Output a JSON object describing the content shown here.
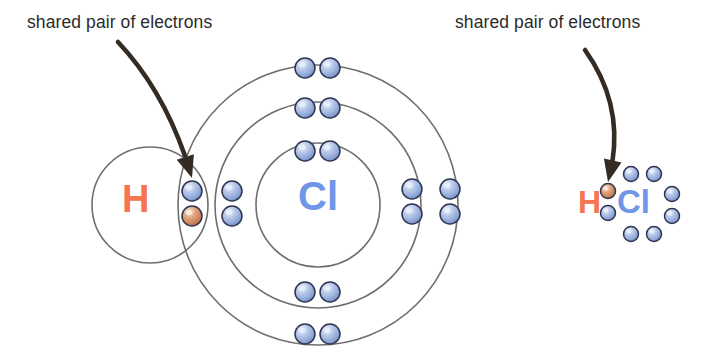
{
  "diagram": {
    "background_color": "#ffffff"
  },
  "annotations": [
    {
      "id": "left-annotation",
      "text": "shared pair of electrons",
      "x": 27,
      "y": 12,
      "arrow": {
        "from": [
          118,
          42
        ],
        "control": [
          168,
          95
        ],
        "to": [
          192,
          178
        ]
      }
    },
    {
      "id": "right-annotation",
      "text": "shared pair of electrons",
      "x": 455,
      "y": 12,
      "arrow": {
        "from": [
          585,
          50
        ],
        "control": [
          628,
          110
        ],
        "to": [
          608,
          182
        ]
      }
    }
  ],
  "left_model": {
    "name": "shell-model",
    "hydrogen": {
      "label": "H",
      "label_color": "#f4754f",
      "circle": {
        "cx": 150,
        "cy": 205,
        "r": 58
      }
    },
    "chlorine": {
      "label": "Cl",
      "label_color": "#6f96e8",
      "shells": [
        {
          "name": "inner-shell",
          "cx": 318,
          "cy": 205,
          "r": 62
        },
        {
          "name": "middle-shell",
          "cx": 318,
          "cy": 205,
          "r": 103
        },
        {
          "name": "outer-shell",
          "cx": 318,
          "cy": 205,
          "r": 140
        }
      ]
    },
    "electron_colors": {
      "chlorine_electron": "#9fb4e0",
      "hydrogen_electron": "#d98a63",
      "rim": "#2f3550",
      "highlight": "#e8eefb"
    },
    "electrons": [
      {
        "name": "shared-electron-cl",
        "cx": 192,
        "cy": 191,
        "r": 10,
        "type": "chlorine"
      },
      {
        "name": "shared-electron-h",
        "cx": 192,
        "cy": 216,
        "r": 10,
        "type": "hydrogen"
      },
      {
        "name": "middle-shell-electron-left-upper",
        "cx": 232,
        "cy": 191,
        "r": 10,
        "type": "chlorine"
      },
      {
        "name": "middle-shell-electron-left-lower",
        "cx": 232,
        "cy": 216,
        "r": 10,
        "type": "chlorine"
      },
      {
        "name": "inner-shell-electron-top-left",
        "cx": 305,
        "cy": 151,
        "r": 10,
        "type": "chlorine"
      },
      {
        "name": "inner-shell-electron-top-right",
        "cx": 330,
        "cy": 151,
        "r": 10,
        "type": "chlorine"
      },
      {
        "name": "middle-shell-electron-top-left",
        "cx": 305,
        "cy": 108,
        "r": 10,
        "type": "chlorine"
      },
      {
        "name": "middle-shell-electron-top-right",
        "cx": 330,
        "cy": 108,
        "r": 10,
        "type": "chlorine"
      },
      {
        "name": "outer-shell-electron-top-left",
        "cx": 305,
        "cy": 68,
        "r": 10,
        "type": "chlorine"
      },
      {
        "name": "outer-shell-electron-top-right",
        "cx": 330,
        "cy": 68,
        "r": 10,
        "type": "chlorine"
      },
      {
        "name": "middle-shell-electron-right-upper",
        "cx": 412,
        "cy": 189,
        "r": 10,
        "type": "chlorine"
      },
      {
        "name": "middle-shell-electron-right-lower",
        "cx": 412,
        "cy": 214,
        "r": 10,
        "type": "chlorine"
      },
      {
        "name": "outer-shell-electron-right-upper",
        "cx": 450,
        "cy": 189,
        "r": 10,
        "type": "chlorine"
      },
      {
        "name": "outer-shell-electron-right-lower",
        "cx": 450,
        "cy": 214,
        "r": 10,
        "type": "chlorine"
      },
      {
        "name": "middle-shell-electron-bottom-left",
        "cx": 305,
        "cy": 292,
        "r": 10,
        "type": "chlorine"
      },
      {
        "name": "middle-shell-electron-bottom-right",
        "cx": 330,
        "cy": 292,
        "r": 10,
        "type": "chlorine"
      },
      {
        "name": "outer-shell-electron-bottom-left",
        "cx": 305,
        "cy": 334,
        "r": 10,
        "type": "chlorine"
      },
      {
        "name": "outer-shell-electron-bottom-right",
        "cx": 330,
        "cy": 334,
        "r": 10,
        "type": "chlorine"
      }
    ]
  },
  "right_model": {
    "name": "lewis-dot-structure",
    "hydrogen": {
      "label": "H",
      "label_color": "#f4754f"
    },
    "chlorine": {
      "label": "Cl",
      "label_color": "#6f96e8"
    },
    "electron_colors": {
      "chlorine_electron": "#9fb4e0",
      "hydrogen_electron": "#d98a63",
      "rim": "#2f3550",
      "highlight": "#e8eefb"
    },
    "electrons": [
      {
        "name": "shared-electron-h",
        "cx": 608,
        "cy": 191,
        "r": 7.5,
        "type": "hydrogen"
      },
      {
        "name": "shared-electron-cl",
        "cx": 608,
        "cy": 213,
        "r": 7.5,
        "type": "chlorine"
      },
      {
        "name": "lone-pair-top-left",
        "cx": 631,
        "cy": 174,
        "r": 7.5,
        "type": "chlorine"
      },
      {
        "name": "lone-pair-top-right",
        "cx": 654,
        "cy": 174,
        "r": 7.5,
        "type": "chlorine"
      },
      {
        "name": "lone-pair-right-upper",
        "cx": 672,
        "cy": 194,
        "r": 7.5,
        "type": "chlorine"
      },
      {
        "name": "lone-pair-right-lower",
        "cx": 672,
        "cy": 216,
        "r": 7.5,
        "type": "chlorine"
      },
      {
        "name": "lone-pair-bottom-left",
        "cx": 631,
        "cy": 234,
        "r": 7.5,
        "type": "chlorine"
      },
      {
        "name": "lone-pair-bottom-right",
        "cx": 654,
        "cy": 234,
        "r": 7.5,
        "type": "chlorine"
      }
    ]
  },
  "style": {
    "shell_stroke": "#6e6e6e",
    "shell_stroke_width": 1.6,
    "arrow_color": "#332b24",
    "text_color": "#2b2b2b"
  }
}
